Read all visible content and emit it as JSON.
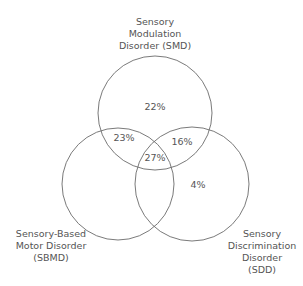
{
  "diagram": {
    "type": "venn",
    "sets": [
      {
        "id": "SMD",
        "label_lines": [
          "Sensory",
          "Modulation",
          "Disorder (SMD)"
        ]
      },
      {
        "id": "SBMD",
        "label_lines": [
          "Sensory-Based",
          "Motor Disorder",
          "(SBMD)"
        ]
      },
      {
        "id": "SDD",
        "label_lines": [
          "Sensory",
          "Discrimination",
          "Disorder",
          "(SDD)"
        ]
      }
    ],
    "regions": {
      "smd_only": "22%",
      "smd_sbmd": "23%",
      "smd_sdd": "16%",
      "all_three": "27%",
      "sdd_only": "4%"
    },
    "stroke_color": "#6b6b6b"
  }
}
